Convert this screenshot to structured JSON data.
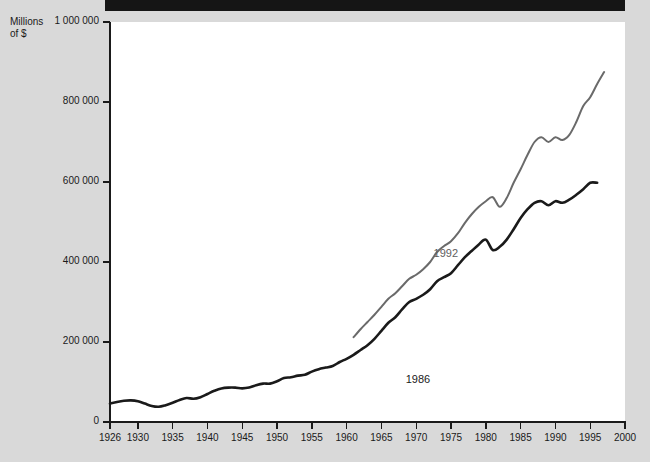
{
  "page": {
    "background_color": "#d9d9d9",
    "top_band_color": "#151515"
  },
  "axis_title": "Millions\nof $",
  "chart_data": {
    "type": "line",
    "title": "",
    "subtitle": "",
    "xlabel": "",
    "ylabel": "Millions of $",
    "xlim": [
      1926,
      2000
    ],
    "ylim": [
      0,
      1000000
    ],
    "grid": false,
    "legend_position": "inline-annotation",
    "y_ticks": [
      0,
      200000,
      400000,
      600000,
      800000,
      1000000
    ],
    "y_tick_labels": [
      "0",
      "200 000",
      "400 000",
      "600 000",
      "800 000",
      "1 000 000"
    ],
    "x_ticks": [
      1926,
      1930,
      1935,
      1940,
      1945,
      1950,
      1955,
      1960,
      1965,
      1970,
      1975,
      1980,
      1985,
      1990,
      1995,
      2000
    ],
    "x_tick_labels": [
      "1926",
      "1930",
      "1935",
      "1940",
      "1945",
      "1950",
      "1955",
      "1960",
      "1965",
      "1970",
      "1975",
      "1980",
      "1985",
      "1990",
      "1995",
      "2000"
    ],
    "annotations": [
      {
        "text": "1992",
        "x": 1974.5,
        "y": 420000,
        "color": "#5e5e5e"
      },
      {
        "text": "1986",
        "x": 1970.5,
        "y": 105000,
        "color": "#1a1a1a"
      }
    ],
    "series": [
      {
        "name": "1992",
        "color": "#6a6a6a",
        "x": [
          1961,
          1962,
          1963,
          1964,
          1965,
          1966,
          1967,
          1968,
          1969,
          1970,
          1971,
          1972,
          1973,
          1974,
          1975,
          1976,
          1977,
          1978,
          1979,
          1980,
          1981,
          1982,
          1983,
          1984,
          1985,
          1986,
          1987,
          1988,
          1989,
          1990,
          1991,
          1992,
          1993,
          1994,
          1995,
          1996,
          1997
        ],
        "values": [
          212000,
          232000,
          250000,
          268000,
          288000,
          308000,
          322000,
          340000,
          358000,
          368000,
          382000,
          400000,
          425000,
          440000,
          452000,
          472000,
          498000,
          520000,
          538000,
          552000,
          562000,
          538000,
          560000,
          598000,
          632000,
          668000,
          700000,
          712000,
          700000,
          712000,
          705000,
          718000,
          750000,
          790000,
          812000,
          845000,
          875000
        ]
      },
      {
        "name": "1986",
        "color": "#1a1a1a",
        "x": [
          1926,
          1927,
          1928,
          1929,
          1930,
          1931,
          1932,
          1933,
          1934,
          1935,
          1936,
          1937,
          1938,
          1939,
          1940,
          1941,
          1942,
          1943,
          1944,
          1945,
          1946,
          1947,
          1948,
          1949,
          1950,
          1951,
          1952,
          1953,
          1954,
          1955,
          1956,
          1957,
          1958,
          1959,
          1960,
          1961,
          1962,
          1963,
          1964,
          1965,
          1966,
          1967,
          1968,
          1969,
          1970,
          1971,
          1972,
          1973,
          1974,
          1975,
          1976,
          1977,
          1978,
          1979,
          1980,
          1981,
          1982,
          1983,
          1984,
          1985,
          1986,
          1987,
          1988,
          1989,
          1990,
          1991,
          1992,
          1993,
          1994,
          1995,
          1996
        ],
        "values": [
          46000,
          50000,
          53000,
          54000,
          52000,
          46000,
          40000,
          38000,
          42000,
          48000,
          55000,
          60000,
          58000,
          62000,
          70000,
          78000,
          84000,
          86000,
          86000,
          84000,
          86000,
          92000,
          96000,
          96000,
          102000,
          110000,
          112000,
          116000,
          118000,
          126000,
          132000,
          136000,
          140000,
          150000,
          158000,
          168000,
          180000,
          192000,
          208000,
          228000,
          248000,
          262000,
          282000,
          300000,
          308000,
          318000,
          332000,
          352000,
          362000,
          372000,
          392000,
          412000,
          428000,
          444000,
          456000,
          430000,
          438000,
          456000,
          482000,
          510000,
          532000,
          548000,
          552000,
          542000,
          552000,
          548000,
          556000,
          568000,
          582000,
          598000,
          598000
        ]
      }
    ]
  }
}
